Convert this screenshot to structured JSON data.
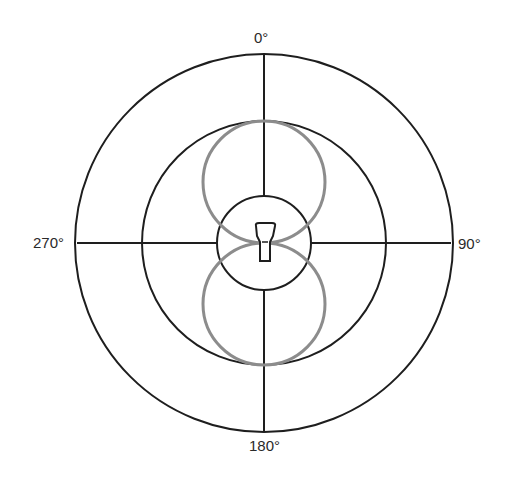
{
  "diagram": {
    "labels": {
      "top": "0°",
      "right": "90°",
      "bottom": "180°",
      "left": "270°"
    },
    "rings": [
      {
        "name": "inner",
        "radius": 47
      },
      {
        "name": "middle",
        "radius": 122
      },
      {
        "name": "outer",
        "radius": 189
      }
    ],
    "pattern": {
      "type": "figure-8",
      "lobes": [
        {
          "name": "front-lobe",
          "direction": "0°"
        },
        {
          "name": "rear-lobe",
          "direction": "180°"
        }
      ],
      "lobe_radius": 62
    },
    "colors": {
      "grid": "#1e1e1e",
      "pattern": "#8c8c8c"
    },
    "center_icon": "microphone-icon"
  }
}
